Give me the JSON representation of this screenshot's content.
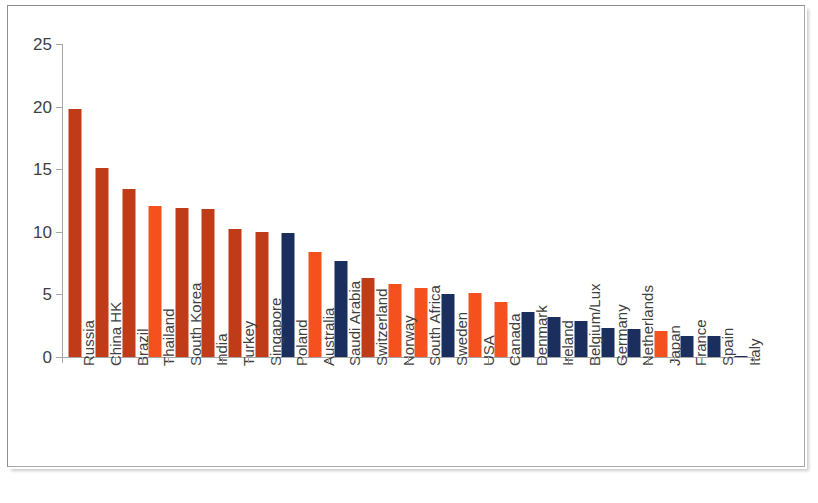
{
  "chart_data": {
    "type": "bar",
    "title": "",
    "subtitle": "",
    "xlabel": "",
    "ylabel": "",
    "ylim": [
      0,
      25
    ],
    "yticks": [
      0,
      5,
      10,
      15,
      20,
      25
    ],
    "ytick_labels": [
      "0",
      "5",
      "10",
      "15",
      "20",
      "25"
    ],
    "grid": false,
    "legend": "none",
    "categories": [
      "Russia",
      "China HK",
      "Brazil",
      "Thailand",
      "South Korea",
      "India",
      "Turkey",
      "Singapore",
      "Poland",
      "Australia",
      "Saudi Arabia",
      "Switzerland",
      "Norway",
      "South Africa",
      "Sweden",
      "USA",
      "Canada",
      "Denmark",
      "Ireland",
      "Belgium/Lux",
      "Germany",
      "Netherlands",
      "Japan",
      "France",
      "Spain",
      "Italy"
    ],
    "values": [
      19.8,
      15.1,
      13.4,
      12.1,
      11.9,
      11.8,
      10.2,
      10.0,
      9.9,
      8.4,
      7.7,
      6.3,
      5.8,
      5.5,
      5.0,
      5.1,
      4.4,
      3.6,
      3.2,
      2.9,
      2.35,
      2.25,
      2.1,
      1.7,
      1.65,
      0.12
    ],
    "bar_colors": [
      "dark_orange",
      "dark_orange",
      "dark_orange",
      "bright_orange",
      "dark_orange",
      "dark_orange",
      "dark_orange",
      "dark_orange",
      "navy",
      "bright_orange",
      "navy",
      "dark_orange",
      "bright_orange",
      "bright_orange",
      "navy",
      "bright_orange",
      "bright_orange",
      "navy",
      "navy",
      "navy",
      "navy",
      "navy",
      "bright_orange",
      "navy",
      "navy",
      "navy"
    ]
  },
  "colors": {
    "dark_orange": "#C03C18",
    "bright_orange": "#F4511E",
    "navy": "#1B2F5E",
    "axis": "#A6A6A6",
    "text": "#3F3F3F",
    "frame": "#8C8C8C",
    "background": "#FFFFFF"
  }
}
